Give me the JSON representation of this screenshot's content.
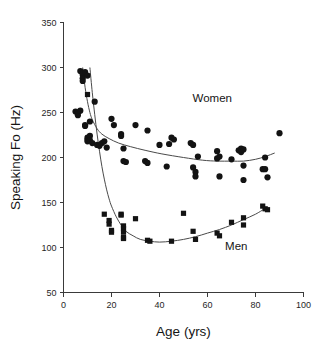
{
  "chart_data": {
    "type": "scatter",
    "title": "",
    "xlabel": "Age (yrs)",
    "ylabel": "Speaking Fo (Hz)",
    "xlim": [
      0,
      100
    ],
    "ylim": [
      50,
      350
    ],
    "xticks": [
      0,
      20,
      40,
      60,
      80,
      100
    ],
    "yticks": [
      50,
      100,
      150,
      200,
      250,
      300,
      350
    ],
    "xtick_labels": [
      "0",
      "20",
      "40",
      "60",
      "80",
      "100"
    ],
    "ytick_labels": [
      "50",
      "100",
      "150",
      "200",
      "250",
      "300",
      "350"
    ],
    "grid": false,
    "legend": "inline-annotations",
    "annotations": [
      {
        "text": "Women",
        "x": 62,
        "y": 262
      },
      {
        "text": "Men",
        "x": 72,
        "y": 97
      }
    ],
    "series": [
      {
        "name": "Women",
        "marker": "circle",
        "color": "#131313",
        "points": [
          [
            5,
            251
          ],
          [
            6,
            250
          ],
          [
            6,
            247
          ],
          [
            7,
            252
          ],
          [
            7,
            296
          ],
          [
            8,
            292
          ],
          [
            8,
            288
          ],
          [
            8,
            285
          ],
          [
            9,
            295
          ],
          [
            9,
            236
          ],
          [
            9,
            235
          ],
          [
            10,
            291
          ],
          [
            10,
            222
          ],
          [
            10,
            220
          ],
          [
            10,
            218
          ],
          [
            11,
            240
          ],
          [
            11,
            224
          ],
          [
            11,
            219
          ],
          [
            12,
            216
          ],
          [
            13,
            262
          ],
          [
            14,
            214
          ],
          [
            15,
            213
          ],
          [
            16,
            216
          ],
          [
            17,
            218
          ],
          [
            18,
            211
          ],
          [
            20,
            243
          ],
          [
            21,
            236
          ],
          [
            24,
            226
          ],
          [
            24,
            224
          ],
          [
            25,
            196
          ],
          [
            25,
            210
          ],
          [
            26,
            195
          ],
          [
            30,
            236
          ],
          [
            34,
            196
          ],
          [
            35,
            194
          ],
          [
            35,
            230
          ],
          [
            40,
            214
          ],
          [
            43,
            190
          ],
          [
            44,
            215
          ],
          [
            45,
            222
          ],
          [
            46,
            220
          ],
          [
            53,
            216
          ],
          [
            54,
            214
          ],
          [
            54,
            189
          ],
          [
            55,
            184
          ],
          [
            55,
            179
          ],
          [
            56,
            201
          ],
          [
            64,
            207
          ],
          [
            64,
            199
          ],
          [
            65,
            201
          ],
          [
            65,
            179
          ],
          [
            70,
            198
          ],
          [
            73,
            208
          ],
          [
            74,
            210
          ],
          [
            74,
            206
          ],
          [
            75,
            209
          ],
          [
            75,
            191
          ],
          [
            75,
            175
          ],
          [
            83,
            187
          ],
          [
            84,
            200
          ],
          [
            84,
            187
          ],
          [
            85,
            178
          ],
          [
            90,
            227
          ]
        ]
      },
      {
        "name": "Men",
        "marker": "square",
        "color": "#131313",
        "points": [
          [
            10,
            270
          ],
          [
            17,
            137
          ],
          [
            19,
            130
          ],
          [
            19,
            126
          ],
          [
            20,
            119
          ],
          [
            20,
            117
          ],
          [
            24,
            137
          ],
          [
            24,
            136
          ],
          [
            25,
            124
          ],
          [
            25,
            121
          ],
          [
            25,
            117
          ],
          [
            25,
            111
          ],
          [
            25,
            110
          ],
          [
            30,
            132
          ],
          [
            35,
            108
          ],
          [
            36,
            107
          ],
          [
            45,
            107
          ],
          [
            50,
            138
          ],
          [
            54,
            118
          ],
          [
            55,
            109
          ],
          [
            64,
            116
          ],
          [
            65,
            113
          ],
          [
            70,
            128
          ],
          [
            75,
            133
          ],
          [
            75,
            125
          ],
          [
            83,
            146
          ],
          [
            84,
            143
          ],
          [
            85,
            142
          ]
        ]
      }
    ],
    "fit_curves": [
      {
        "name": "Women fit",
        "for_series": "Women",
        "description": "decaying then slightly rising smooth fit",
        "points": [
          [
            8,
            300
          ],
          [
            9,
            278
          ],
          [
            10,
            262
          ],
          [
            11,
            250
          ],
          [
            12,
            242
          ],
          [
            14,
            232
          ],
          [
            16,
            226
          ],
          [
            19,
            221
          ],
          [
            23,
            216
          ],
          [
            28,
            212
          ],
          [
            34,
            208
          ],
          [
            41,
            204
          ],
          [
            50,
            200
          ],
          [
            58,
            197
          ],
          [
            64,
            196
          ],
          [
            70,
            196
          ],
          [
            75,
            196
          ],
          [
            80,
            198
          ],
          [
            84,
            201
          ],
          [
            88,
            205
          ]
        ]
      },
      {
        "name": "Men fit",
        "for_series": "Men",
        "description": "steep decline to minimum near age 40 then gradual rise",
        "points": [
          [
            11,
            300
          ],
          [
            12,
            272
          ],
          [
            13,
            248
          ],
          [
            14,
            226
          ],
          [
            15,
            207
          ],
          [
            16,
            190
          ],
          [
            17,
            176
          ],
          [
            18,
            164
          ],
          [
            19,
            154
          ],
          [
            20,
            146
          ],
          [
            22,
            134
          ],
          [
            24,
            125
          ],
          [
            26,
            118
          ],
          [
            29,
            113
          ],
          [
            32,
            109
          ],
          [
            36,
            107
          ],
          [
            40,
            106
          ],
          [
            45,
            107
          ],
          [
            50,
            109
          ],
          [
            55,
            112
          ],
          [
            60,
            116
          ],
          [
            65,
            120
          ],
          [
            70,
            125
          ],
          [
            75,
            131
          ],
          [
            80,
            137
          ],
          [
            85,
            145
          ]
        ]
      }
    ]
  },
  "figure": {
    "background_color": "#ffffff",
    "axis_color": "#3a3a3a",
    "marker_color": "#131313",
    "curve_color": "#4a4a4a"
  }
}
